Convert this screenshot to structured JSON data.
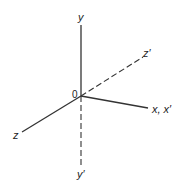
{
  "diagram": {
    "type": "3d-coordinate-axes",
    "origin_label": "0",
    "axes": [
      {
        "name": "y",
        "label": "y",
        "style": "solid",
        "direction": "up"
      },
      {
        "name": "y-prime",
        "label": "y′",
        "style": "dashed",
        "direction": "down"
      },
      {
        "name": "x",
        "label": "x, x′",
        "style": "solid",
        "direction": "right"
      },
      {
        "name": "z",
        "label": "z",
        "style": "solid",
        "direction": "lower-left"
      },
      {
        "name": "z-prime",
        "label": "z′",
        "style": "dashed",
        "direction": "upper-right"
      }
    ],
    "colors": {
      "line": "#333333",
      "background": "#ffffff"
    }
  }
}
